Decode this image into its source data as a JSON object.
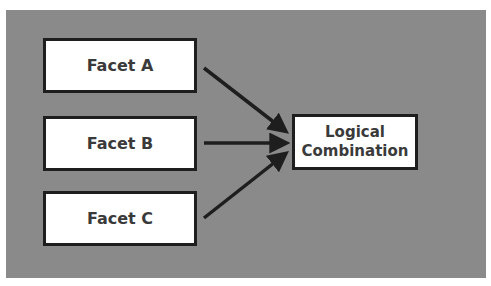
{
  "diagram": {
    "type": "flow",
    "background_color": "#8a8a8a",
    "nodes": [
      {
        "id": "facet-a",
        "label": "Facet A"
      },
      {
        "id": "facet-b",
        "label": "Facet B"
      },
      {
        "id": "facet-c",
        "label": "Facet C"
      },
      {
        "id": "combo",
        "label_line1": "Logical",
        "label_line2": "Combination"
      }
    ],
    "edges": [
      {
        "from": "facet-a",
        "to": "combo"
      },
      {
        "from": "facet-b",
        "to": "combo"
      },
      {
        "from": "facet-c",
        "to": "combo"
      }
    ]
  }
}
